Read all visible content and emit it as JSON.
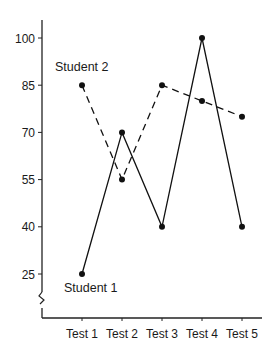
{
  "chart_data": {
    "type": "line",
    "title": "",
    "xlabel": "",
    "ylabel": "",
    "categories": [
      "Test 1",
      "Test 2",
      "Test 3",
      "Test 4",
      "Test 5"
    ],
    "y_ticks": [
      25,
      40,
      55,
      70,
      85,
      100
    ],
    "ylim": [
      25,
      100
    ],
    "axis_break": true,
    "grid": false,
    "legend": "inline-labels",
    "series": [
      {
        "name": "Student 1",
        "style": "solid",
        "values": [
          25,
          70,
          40,
          100,
          40
        ],
        "label_position": "below-first-point"
      },
      {
        "name": "Student 2",
        "style": "dashed",
        "values": [
          85,
          55,
          85,
          80,
          75
        ],
        "label_position": "above-first-point"
      }
    ],
    "colors": {
      "line": "#111111",
      "axis": "#222222",
      "text": "#1a1a1a"
    }
  }
}
